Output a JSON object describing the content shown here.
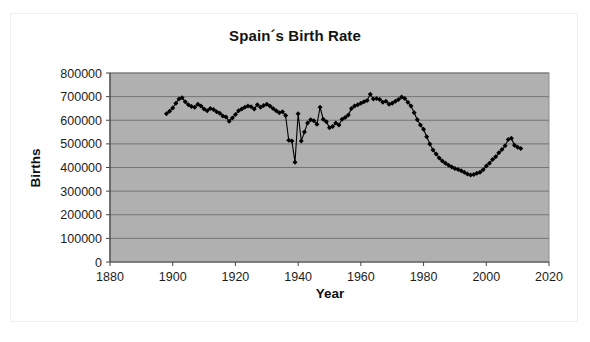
{
  "chart_data": {
    "type": "line",
    "title": "Spain´s Birth Rate",
    "xlabel": "Year",
    "ylabel": "Births",
    "xlim": [
      1880,
      2020
    ],
    "ylim": [
      0,
      800000
    ],
    "xticks": [
      1880,
      1900,
      1920,
      1940,
      1960,
      1980,
      2000,
      2020
    ],
    "xtick_labels": [
      "1880",
      "1900",
      "1920",
      "1940",
      "1960",
      "1980",
      "2000",
      "2020"
    ],
    "yticks": [
      0,
      100000,
      200000,
      300000,
      400000,
      500000,
      600000,
      700000,
      800000
    ],
    "ytick_labels": [
      "0",
      "100000",
      "200000",
      "300000",
      "400000",
      "500000",
      "600000",
      "700000",
      "800000"
    ],
    "grid": "horizontal",
    "legend": "none",
    "plot_background_color": "#b0b0b0",
    "series_color": "#000000",
    "marker": "diamond",
    "series": [
      {
        "name": "Births",
        "x": [
          1898,
          1899,
          1900,
          1901,
          1902,
          1903,
          1904,
          1905,
          1906,
          1907,
          1908,
          1909,
          1910,
          1911,
          1912,
          1913,
          1914,
          1915,
          1916,
          1917,
          1918,
          1919,
          1920,
          1921,
          1922,
          1923,
          1924,
          1925,
          1926,
          1927,
          1928,
          1929,
          1930,
          1931,
          1932,
          1933,
          1934,
          1935,
          1936,
          1937,
          1938,
          1939,
          1940,
          1941,
          1942,
          1943,
          1944,
          1945,
          1946,
          1947,
          1948,
          1949,
          1950,
          1951,
          1952,
          1953,
          1954,
          1955,
          1956,
          1957,
          1958,
          1959,
          1960,
          1961,
          1962,
          1963,
          1964,
          1965,
          1966,
          1967,
          1968,
          1969,
          1970,
          1971,
          1972,
          1973,
          1974,
          1975,
          1976,
          1977,
          1978,
          1979,
          1980,
          1981,
          1982,
          1983,
          1984,
          1985,
          1986,
          1987,
          1988,
          1989,
          1990,
          1991,
          1992,
          1993,
          1994,
          1995,
          1996,
          1997,
          1998,
          1999,
          2000,
          2001,
          2002,
          2003,
          2004,
          2005,
          2006,
          2007,
          2008,
          2009,
          2010,
          2011
        ],
        "values": [
          628000,
          638000,
          652000,
          672000,
          690000,
          695000,
          678000,
          666000,
          658000,
          655000,
          668000,
          660000,
          648000,
          640000,
          650000,
          645000,
          636000,
          630000,
          618000,
          614000,
          596000,
          610000,
          624000,
          640000,
          648000,
          655000,
          660000,
          657000,
          648000,
          666000,
          655000,
          662000,
          668000,
          660000,
          650000,
          640000,
          632000,
          636000,
          620000,
          515000,
          512000,
          422000,
          628000,
          512000,
          550000,
          588000,
          602000,
          598000,
          583000,
          655000,
          604000,
          594000,
          568000,
          574000,
          588000,
          580000,
          604000,
          612000,
          622000,
          650000,
          660000,
          666000,
          672000,
          678000,
          684000,
          710000,
          690000,
          692000,
          688000,
          676000,
          680000,
          668000,
          672000,
          680000,
          688000,
          698000,
          692000,
          676000,
          660000,
          632000,
          602000,
          580000,
          562000,
          530000,
          500000,
          474000,
          457000,
          440000,
          427000,
          418000,
          410000,
          402000,
          396000,
          392000,
          386000,
          380000,
          372000,
          368000,
          370000,
          376000,
          380000,
          390000,
          406000,
          418000,
          434000,
          445000,
          462000,
          476000,
          492000,
          518000,
          524000,
          494000,
          486000,
          480000
        ]
      }
    ]
  }
}
